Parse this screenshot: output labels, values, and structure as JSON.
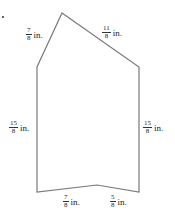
{
  "figure": {
    "shape": "pentagon-like hexagon",
    "stroke_color": "#7a7a7a",
    "vertices": [
      [
        62,
        13
      ],
      [
        139,
        67
      ],
      [
        139,
        192
      ],
      [
        97,
        185
      ],
      [
        37,
        192
      ],
      [
        37,
        67
      ]
    ],
    "labels": [
      {
        "id": "top-left",
        "num": "7",
        "den": "8",
        "unit": "in.",
        "x": 26,
        "y": 27
      },
      {
        "id": "top-right",
        "num": "11",
        "den": "8",
        "unit": "in.",
        "x": 102,
        "y": 25
      },
      {
        "id": "left",
        "num": "15",
        "den": "8",
        "unit": "in.",
        "x": 9,
        "y": 120
      },
      {
        "id": "right",
        "num": "15",
        "den": "8",
        "unit": "in.",
        "x": 143,
        "y": 120
      },
      {
        "id": "bottom-left",
        "num": "7",
        "den": "8",
        "unit": "in.",
        "x": 63,
        "y": 194
      },
      {
        "id": "bottom-right",
        "num": "5",
        "den": "8",
        "unit": "in.",
        "x": 110,
        "y": 194
      }
    ]
  }
}
